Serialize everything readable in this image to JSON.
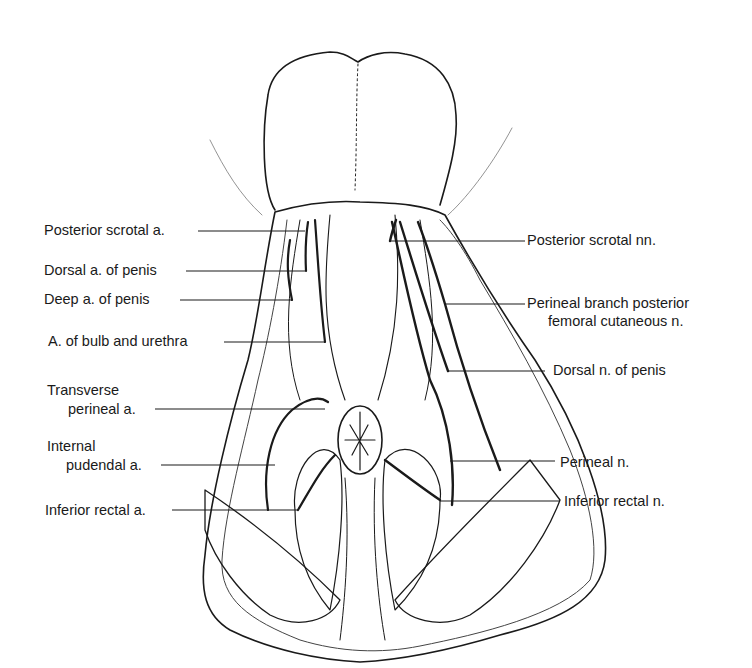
{
  "figure": {
    "left_labels": [
      {
        "id": "posterior-scrotal-a",
        "lines": [
          "Posterior scrotal a."
        ],
        "x": 44,
        "y": 222,
        "line_end": 305,
        "line_y": 231
      },
      {
        "id": "dorsal-a-penis",
        "lines": [
          "Dorsal a. of penis"
        ],
        "x": 44,
        "y": 262,
        "line_end": 305,
        "line_y": 271
      },
      {
        "id": "deep-a-penis",
        "lines": [
          "Deep a. of penis"
        ],
        "x": 44,
        "y": 291,
        "line_end": 292,
        "line_y": 300
      },
      {
        "id": "a-bulb-urethra",
        "lines": [
          "A. of bulb and urethra"
        ],
        "x": 48,
        "y": 333,
        "line_end": 325,
        "line_y": 342
      },
      {
        "id": "transverse-perineal-a",
        "lines": [
          "Transverse",
          "perineal a."
        ],
        "x": 47,
        "y": 382,
        "line_end": 325,
        "line_y": 409
      },
      {
        "id": "internal-pudendal-a",
        "lines": [
          "Internal",
          "pudendal a."
        ],
        "x": 47,
        "y": 438,
        "line_end": 275,
        "line_y": 465
      },
      {
        "id": "inferior-rectal-a",
        "lines": [
          "Inferior rectal a."
        ],
        "x": 45,
        "y": 502,
        "line_end": 298,
        "line_y": 510
      }
    ],
    "right_labels": [
      {
        "id": "posterior-scrotal-nn",
        "lines": [
          "Posterior scrotal nn."
        ],
        "x": 528,
        "y": 232,
        "line_start": 390,
        "line_y": 241
      },
      {
        "id": "perineal-branch-posterior-femoral-cutaneous-n",
        "lines": [
          "Perineal branch posterior",
          "femoral cutaneous n."
        ],
        "x": 528,
        "y": 295,
        "line_start": 445,
        "line_y": 304
      },
      {
        "id": "dorsal-n-penis",
        "lines": [
          "Dorsal n. of penis"
        ],
        "x": 554,
        "y": 362,
        "line_start": 448,
        "line_y": 371
      },
      {
        "id": "perineal-n",
        "lines": [
          "Perineal n."
        ],
        "x": 560,
        "y": 454,
        "line_start": 450,
        "line_y": 461
      },
      {
        "id": "inferior-rectal-n",
        "lines": [
          "Inferior rectal n."
        ],
        "x": 564,
        "y": 493,
        "line_start": 440,
        "line_y": 501
      }
    ]
  }
}
